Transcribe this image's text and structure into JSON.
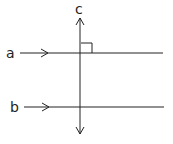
{
  "diagram": {
    "lines": [
      {
        "id": "a",
        "label": "a",
        "orientation": "horizontal"
      },
      {
        "id": "b",
        "label": "b",
        "orientation": "horizontal"
      },
      {
        "id": "c",
        "label": "c",
        "orientation": "vertical",
        "arrows": "both"
      }
    ],
    "annotations": {
      "right_angle": "c ⟂ a",
      "parallel_marks": "single arrow on a and b"
    },
    "colors": {
      "stroke": "#222222",
      "background": "#ffffff"
    }
  }
}
